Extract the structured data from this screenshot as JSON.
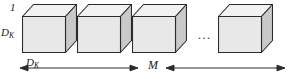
{
  "figure": {
    "type": "diagram",
    "background_color": "#ffffff"
  },
  "labels": {
    "depth_one": "1",
    "height_dk": {
      "base": "D",
      "sub": "K"
    },
    "width_dk": {
      "base": "D",
      "sub": "K"
    },
    "span_m": "M",
    "ellipsis": "..."
  },
  "cubes": [
    {
      "name": "filter-cube-1",
      "x": 22,
      "y": 16
    },
    {
      "name": "filter-cube-2",
      "x": 77,
      "y": 16
    },
    {
      "name": "filter-cube-3",
      "x": 132,
      "y": 16
    },
    {
      "name": "filter-cube-4",
      "x": 218,
      "y": 16
    }
  ],
  "colors": {
    "front_face": "#e8e8e8",
    "top_face": "#f2f2f2",
    "side_face": "#c9c9c9",
    "outline": "#2b2b2b",
    "text": "#1a1a1a",
    "arrow": "#2b2b2b"
  },
  "arrow": {
    "name": "m-span-arrow",
    "style": "double-headed",
    "left_segment": {
      "x1": 20,
      "x2": 138
    },
    "right_segment": {
      "x1": 168,
      "x2": 285
    }
  }
}
